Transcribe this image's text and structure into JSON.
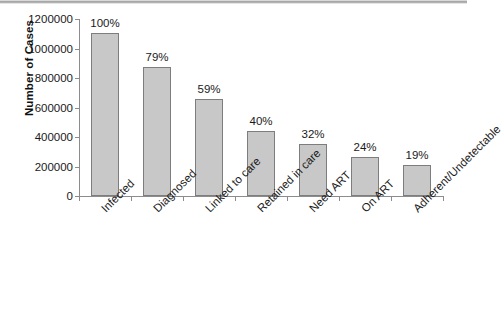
{
  "chart_data": {
    "type": "bar",
    "title": "",
    "subtitle": "",
    "xlabel": "",
    "ylabel": "Number of Cases",
    "ylim": [
      0,
      1200000
    ],
    "ytick_labels": [
      "0",
      "200000",
      "400000",
      "600000",
      "800000",
      "1000000",
      "1200000"
    ],
    "ytick_values": [
      0,
      200000,
      400000,
      600000,
      800000,
      1000000,
      1200000
    ],
    "grid": false,
    "legend": null,
    "legend_position": "none",
    "categories": [
      "Infected",
      "Diagnosed",
      "Linked to care",
      "Retained in care",
      "Need ART",
      "On ART",
      "Adherent/Undetectable"
    ],
    "values": [
      1105000,
      873000,
      655000,
      442000,
      354000,
      265000,
      210000
    ],
    "data_labels": [
      "100%",
      "79%",
      "59%",
      "40%",
      "32%",
      "24%",
      "19%"
    ],
    "bar_fill_color": "#c8c8c8",
    "bar_border_color": "#7d7d7d",
    "axis_color": "#8c8c8c",
    "background_color": "#ffffff"
  }
}
